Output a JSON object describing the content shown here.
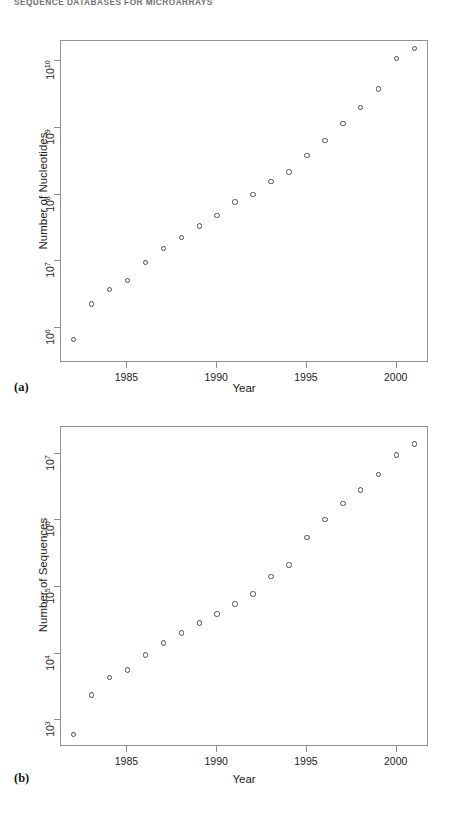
{
  "running_head": {
    "text": "SEQUENCE DATABASES FOR MICROARRAYS"
  },
  "figure": {
    "panels": [
      {
        "id": "a",
        "label": "(a)",
        "chart_data": {
          "type": "scatter",
          "title": "",
          "xlabel": "Year",
          "ylabel": "Number of Nucleotides",
          "xlim": [
            1981.3,
            2001.8
          ],
          "ylim": [
            300000,
            20000000000
          ],
          "yscale": "log",
          "xscale": "linear",
          "grid": false,
          "legend": null,
          "marker": "open-circle",
          "xticks": [
            1985,
            1990,
            1995,
            2000
          ],
          "xtick_labels": [
            "1985",
            "1990",
            "1995",
            "2000"
          ],
          "yticks": [
            1000000,
            10000000,
            100000000,
            1000000000,
            10000000000
          ],
          "ytick_labels": [
            "10",
            "10",
            "10",
            "10",
            "10"
          ],
          "ytick_exponents": [
            "6",
            "7",
            "8",
            "9",
            "10"
          ],
          "x": [
            1982,
            1983,
            1984,
            1985,
            1986,
            1987,
            1988,
            1989,
            1990,
            1991,
            1992,
            1993,
            1994,
            1995,
            1996,
            1997,
            1998,
            1999,
            2000,
            2001
          ],
          "values": [
            680000,
            2300000,
            3800000,
            5200000,
            9600000,
            15500000,
            23000000,
            34000000,
            49000000,
            77000000,
            101000000,
            157000000,
            217000000,
            384000000,
            651000000,
            1160000000,
            2010000000,
            3840000000,
            11000000000.0,
            15500000000.0
          ],
          "series": [
            {
              "name": "Number of Nucleotides",
              "points": [
                {
                  "year": 1982,
                  "value": 680000
                },
                {
                  "year": 1983,
                  "value": 2300000
                },
                {
                  "year": 1984,
                  "value": 3800000
                },
                {
                  "year": 1985,
                  "value": 5200000
                },
                {
                  "year": 1986,
                  "value": 9600000
                },
                {
                  "year": 1987,
                  "value": 15500000
                },
                {
                  "year": 1988,
                  "value": 23000000
                },
                {
                  "year": 1989,
                  "value": 34000000
                },
                {
                  "year": 1990,
                  "value": 49000000
                },
                {
                  "year": 1991,
                  "value": 77000000
                },
                {
                  "year": 1992,
                  "value": 101000000
                },
                {
                  "year": 1993,
                  "value": 157000000
                },
                {
                  "year": 1994,
                  "value": 217000000
                },
                {
                  "year": 1995,
                  "value": 384000000
                },
                {
                  "year": 1996,
                  "value": 651000000
                },
                {
                  "year": 1997,
                  "value": 1160000000
                },
                {
                  "year": 1998,
                  "value": 2010000000
                },
                {
                  "year": 1999,
                  "value": 3840000000
                },
                {
                  "year": 2000,
                  "value": 11000000000
                },
                {
                  "year": 2001,
                  "value": 15500000000
                }
              ]
            }
          ]
        }
      },
      {
        "id": "b",
        "label": "(b)",
        "chart_data": {
          "type": "scatter",
          "title": "",
          "xlabel": "Year",
          "ylabel": "Number of Sequences",
          "xlim": [
            1981.3,
            2001.8
          ],
          "ylim": [
            400,
            25000000
          ],
          "yscale": "log",
          "xscale": "linear",
          "grid": false,
          "legend": null,
          "marker": "open-circle",
          "xticks": [
            1985,
            1990,
            1995,
            2000
          ],
          "xtick_labels": [
            "1985",
            "1990",
            "1995",
            "2000"
          ],
          "yticks": [
            1000,
            10000,
            100000,
            1000000,
            10000000
          ],
          "ytick_labels": [
            "10",
            "10",
            "10",
            "10",
            "10"
          ],
          "ytick_exponents": [
            "3",
            "4",
            "5",
            "6",
            "7"
          ],
          "x": [
            1982,
            1983,
            1984,
            1985,
            1986,
            1987,
            1988,
            1989,
            1990,
            1991,
            1992,
            1993,
            1994,
            1995,
            1996,
            1997,
            1998,
            1999,
            2000,
            2001
          ],
          "values": [
            610,
            2400,
            4400,
            5700,
            9600,
            14500,
            20500,
            28800,
            39500,
            55500,
            78600,
            143000,
            215000,
            555000,
            1020000,
            1770000,
            2840000,
            4860000,
            9500000,
            14000000
          ],
          "series": [
            {
              "name": "Number of Sequences",
              "points": [
                {
                  "year": 1982,
                  "value": 610
                },
                {
                  "year": 1983,
                  "value": 2400
                },
                {
                  "year": 1984,
                  "value": 4400
                },
                {
                  "year": 1985,
                  "value": 5700
                },
                {
                  "year": 1986,
                  "value": 9600
                },
                {
                  "year": 1987,
                  "value": 14500
                },
                {
                  "year": 1988,
                  "value": 20500
                },
                {
                  "year": 1989,
                  "value": 28800
                },
                {
                  "year": 1990,
                  "value": 39500
                },
                {
                  "year": 1991,
                  "value": 55500
                },
                {
                  "year": 1992,
                  "value": 78600
                },
                {
                  "year": 1993,
                  "value": 143000
                },
                {
                  "year": 1994,
                  "value": 215000
                },
                {
                  "year": 1995,
                  "value": 555000
                },
                {
                  "year": 1996,
                  "value": 1020000
                },
                {
                  "year": 1997,
                  "value": 1770000
                },
                {
                  "year": 1998,
                  "value": 2840000
                },
                {
                  "year": 1999,
                  "value": 4860000
                },
                {
                  "year": 2000,
                  "value": 9500000
                },
                {
                  "year": 2001,
                  "value": 14000000
                }
              ]
            }
          ]
        }
      }
    ]
  }
}
